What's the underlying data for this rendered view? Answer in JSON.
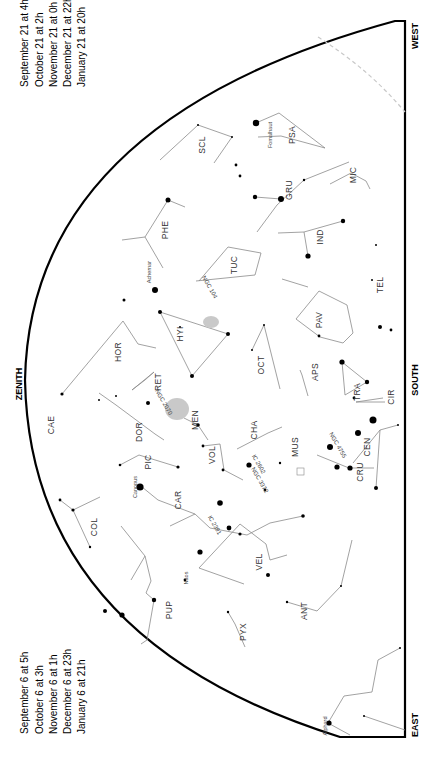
{
  "chart": {
    "directions": {
      "zenith": "ZENITH",
      "south": "SOUTH",
      "east": "EAST",
      "west": "WEST"
    },
    "times_top": [
      "September 21 at  4h",
      "October 21 at  2h",
      "November 21 at  0h",
      "December 21 at 22h",
      "January 21 at 20h"
    ],
    "times_bottom": [
      "September 6 at  5h",
      "October 6 at  3h",
      "November 6 at  1h",
      "December 6 at 23h",
      "January 6 at 21h"
    ],
    "constellations": [
      {
        "abbr": "SCL",
        "x": 205,
        "y": 145
      },
      {
        "abbr": "PSA",
        "x": 295,
        "y": 135
      },
      {
        "abbr": "MIC",
        "x": 356,
        "y": 175
      },
      {
        "abbr": "GRU",
        "x": 292,
        "y": 190
      },
      {
        "abbr": "PHE",
        "x": 168,
        "y": 230
      },
      {
        "abbr": "IND",
        "x": 323,
        "y": 237
      },
      {
        "abbr": "TUC",
        "x": 237,
        "y": 265
      },
      {
        "abbr": "TEL",
        "x": 383,
        "y": 285
      },
      {
        "abbr": "HOR",
        "x": 121,
        "y": 352
      },
      {
        "abbr": "HYI",
        "x": 183,
        "y": 334
      },
      {
        "abbr": "PAV",
        "x": 322,
        "y": 320
      },
      {
        "abbr": "OCT",
        "x": 264,
        "y": 365
      },
      {
        "abbr": "APS",
        "x": 318,
        "y": 372
      },
      {
        "abbr": "RET",
        "x": 161,
        "y": 382
      },
      {
        "abbr": "TRA",
        "x": 360,
        "y": 392
      },
      {
        "abbr": "CAE",
        "x": 54,
        "y": 425
      },
      {
        "abbr": "DOR",
        "x": 142,
        "y": 432
      },
      {
        "abbr": "MEN",
        "x": 198,
        "y": 420
      },
      {
        "abbr": "CIR",
        "x": 394,
        "y": 397
      },
      {
        "abbr": "CHA",
        "x": 257,
        "y": 430
      },
      {
        "abbr": "PIC",
        "x": 151,
        "y": 462
      },
      {
        "abbr": "VOL",
        "x": 215,
        "y": 455
      },
      {
        "abbr": "MUS",
        "x": 298,
        "y": 447
      },
      {
        "abbr": "CEN",
        "x": 370,
        "y": 447
      },
      {
        "abbr": "CRU",
        "x": 363,
        "y": 472
      },
      {
        "abbr": "CAR",
        "x": 181,
        "y": 500
      },
      {
        "abbr": "COL",
        "x": 97,
        "y": 527
      },
      {
        "abbr": "VEL",
        "x": 262,
        "y": 562
      },
      {
        "abbr": "PUP",
        "x": 172,
        "y": 610
      },
      {
        "abbr": "ANT",
        "x": 307,
        "y": 611
      },
      {
        "abbr": "PYX",
        "x": 246,
        "y": 632
      }
    ],
    "star_names": [
      {
        "name": "Fomalhaut",
        "x": 272,
        "y": 135
      },
      {
        "name": "Achernar",
        "x": 151,
        "y": 272
      },
      {
        "name": "Canopus",
        "x": 137,
        "y": 487
      },
      {
        "name": "Naos",
        "x": 188,
        "y": 578
      },
      {
        "name": "Alphard",
        "x": 327,
        "y": 726
      }
    ],
    "deep_sky": [
      {
        "label": "NGC 104",
        "x": 208,
        "y": 288
      },
      {
        "label": "NGC 2070",
        "x": 162,
        "y": 403
      },
      {
        "label": "NGC 4755",
        "x": 336,
        "y": 446
      },
      {
        "label": "NGC 3372",
        "x": 258,
        "y": 481
      },
      {
        "label": "IC 2602",
        "x": 257,
        "y": 465
      },
      {
        "label": "IC 2391",
        "x": 213,
        "y": 526
      }
    ]
  }
}
